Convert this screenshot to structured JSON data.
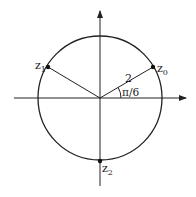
{
  "diagram": {
    "type": "complex-plane-roots",
    "circle": {
      "center": [
        100,
        98
      ],
      "radius": 62
    },
    "axes": {
      "x": {
        "from": 14,
        "to": 186,
        "y": 98
      },
      "y": {
        "from": 186,
        "to": 11,
        "x": 100
      }
    },
    "points": [
      {
        "id": "z0",
        "label": "z",
        "sub": "0",
        "x": 153,
        "y": 67
      },
      {
        "id": "z1",
        "label": "z",
        "sub": "1",
        "x": 48,
        "y": 67
      },
      {
        "id": "z2",
        "label": "z",
        "sub": "2",
        "x": 100,
        "y": 161
      }
    ],
    "radius_label": "2",
    "angle_label": "π/6",
    "line_color": "#222222"
  }
}
